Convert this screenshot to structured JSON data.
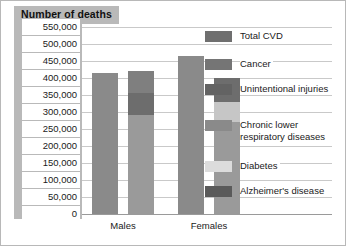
{
  "chart_data": {
    "type": "bar",
    "title": "Number of deaths",
    "xlabel": "",
    "ylabel": "Number of deaths",
    "categories": [
      "Males",
      "Females"
    ],
    "ylim": [
      0,
      550000
    ],
    "ytick_step": 50000,
    "ytick_labels": [
      "550,000",
      "500,000",
      "450,000",
      "400,000",
      "350,000",
      "300,000",
      "250,000",
      "200,000",
      "150,000",
      "100,000",
      "50,000",
      "0"
    ],
    "ytick_values": [
      550000,
      500000,
      450000,
      400000,
      350000,
      300000,
      250000,
      200000,
      150000,
      100000,
      50000,
      0
    ],
    "grid": true,
    "legend_position": "right",
    "legend": [
      "Total CVD",
      "Cancer",
      "Unintentional injuries",
      "Chronic lower respiratory diseases",
      "Diabetes",
      "Alzheimer's disease"
    ],
    "series": [
      {
        "name": "Total CVD",
        "values": [
          415000,
          465000
        ],
        "color": "#8a8a8a"
      },
      {
        "name": "Cancer",
        "values": [
          290000,
          270000
        ],
        "color": "#9a9a9a"
      },
      {
        "name": "Unintentional injuries",
        "values": [
          75000,
          40000
        ],
        "color": "#6b6b6b"
      },
      {
        "name": "Chronic lower respiratory diseases",
        "values": [
          60000,
          65000
        ],
        "color": "#7d7d7d"
      },
      {
        "name": "Diabetes",
        "values": [
          38000,
          35000
        ],
        "color": "#d6d6d6"
      },
      {
        "name": "Alzheimer's disease",
        "values": [
          25000,
          50000
        ],
        "color": "#5f5f5f"
      }
    ]
  },
  "legend_items": [
    {
      "label": "Total CVD",
      "color": "#6f6f6f"
    },
    {
      "label": "Cancer",
      "color": "#757575"
    },
    {
      "label": "Unintentional injuries",
      "color": "#636363"
    },
    {
      "label": "Chronic lower respiratory diseases",
      "color": "#8a8a8a"
    },
    {
      "label": "Diabetes",
      "color": "#dcdcdc"
    },
    {
      "label": "Alzheimer's disease",
      "color": "#5a5a5a"
    }
  ],
  "bars": [
    {
      "group": "Males",
      "name": "males-bar-1",
      "left": 10,
      "width": 26,
      "segments": [
        {
          "value": 415000,
          "color": "#8a8a8a"
        }
      ]
    },
    {
      "group": "Males",
      "name": "males-bar-2",
      "left": 46,
      "width": 26,
      "segments": [
        {
          "value": 290000,
          "color": "#9a9a9a"
        },
        {
          "value": 65000,
          "color": "#6d6d6d"
        },
        {
          "value": 65000,
          "color": "#7f7f7f"
        }
      ]
    },
    {
      "group": "Females",
      "name": "females-bar-1",
      "left": 96,
      "width": 26,
      "segments": [
        {
          "value": 465000,
          "color": "#8a8a8a"
        }
      ]
    },
    {
      "group": "Females",
      "name": "females-bar-2",
      "left": 132,
      "width": 26,
      "segments": [
        {
          "value": 270000,
          "color": "#9a9a9a"
        },
        {
          "value": 60000,
          "color": "#c6c6c6"
        },
        {
          "value": 70000,
          "color": "#6d6d6d"
        }
      ]
    }
  ],
  "x_axis": {
    "labels": [
      {
        "text": "Males",
        "center": 123
      },
      {
        "text": "Females",
        "center": 209
      }
    ]
  }
}
